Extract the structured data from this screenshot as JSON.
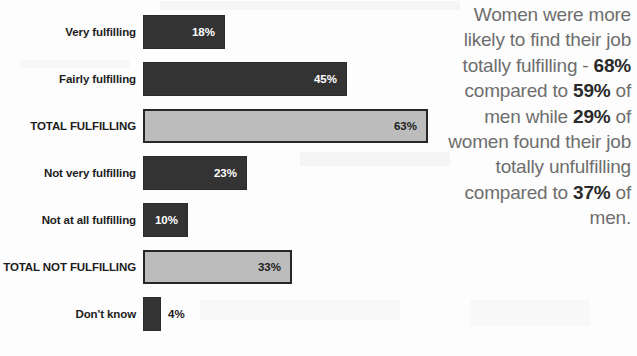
{
  "chart_data": {
    "type": "bar",
    "orientation": "horizontal",
    "title": "",
    "xlabel": "",
    "ylabel": "",
    "xlim": [
      0,
      70
    ],
    "grid": false,
    "legend": null,
    "value_suffix": "%",
    "categories": [
      "Very fulfilling",
      "Fairly fulfilling",
      "TOTAL FULFILLING",
      "Not very fulfilling",
      "Not at all fulfilling",
      "TOTAL NOT FULFILLING",
      "Don't know"
    ],
    "values": [
      18,
      45,
      63,
      23,
      10,
      33,
      4
    ],
    "value_labels": [
      "18%",
      "45%",
      "63%",
      "23%",
      "10%",
      "33%",
      "4%"
    ],
    "bar_styles": [
      "dark",
      "dark",
      "light",
      "dark",
      "dark",
      "light",
      "dark"
    ],
    "label_placement": [
      "inside",
      "inside",
      "inside",
      "inside",
      "inside",
      "inside",
      "outside"
    ],
    "colors": {
      "dark_fill": "#333333",
      "dark_border": "#2b2b2b",
      "light_fill": "#bcbcbc",
      "light_border": "#262626",
      "dark_value_text": "#ffffff",
      "light_value_text": "#1c1c1c",
      "category_text": "#1c1c1c",
      "sidenote_text": "#6e6e6e",
      "sidenote_highlight": "#2a2a2a",
      "background": "#ffffff"
    },
    "rows": [
      {
        "category": "Very fulfilling",
        "value": 18,
        "label": "18%",
        "style": "dark",
        "placement": "inside"
      },
      {
        "category": "Fairly fulfilling",
        "value": 45,
        "label": "45%",
        "style": "dark",
        "placement": "inside"
      },
      {
        "category": "TOTAL FULFILLING",
        "value": 63,
        "label": "63%",
        "style": "light",
        "placement": "inside"
      },
      {
        "category": "Not very fulfilling",
        "value": 23,
        "label": "23%",
        "style": "dark",
        "placement": "inside"
      },
      {
        "category": "Not at all fulfilling",
        "value": 10,
        "label": "10%",
        "style": "dark",
        "placement": "inside"
      },
      {
        "category": "TOTAL NOT FULFILLING",
        "value": 33,
        "label": "33%",
        "style": "light",
        "placement": "inside"
      },
      {
        "category": "Don't know",
        "value": 4,
        "label": "4%",
        "style": "dark",
        "placement": "outside"
      }
    ]
  },
  "chart": {
    "rows": [
      {
        "label": "Very fulfilling",
        "value": "18%"
      },
      {
        "label": "Fairly fulfilling",
        "value": "45%"
      },
      {
        "label": "TOTAL FULFILLING",
        "value": "63%"
      },
      {
        "label": "Not very fulfilling",
        "value": "23%"
      },
      {
        "label": "Not at all fulfilling",
        "value": "10%"
      },
      {
        "label": "TOTAL NOT FULFILLING",
        "value": "33%"
      },
      {
        "label": "Don't know",
        "value": "4%"
      }
    ]
  },
  "sidenote": {
    "segments": [
      {
        "text": "Women were more likely to find their job totally fulfilling - ",
        "bold": false
      },
      {
        "text": "68%",
        "bold": true
      },
      {
        "text": " compared to ",
        "bold": false
      },
      {
        "text": "59%",
        "bold": true
      },
      {
        "text": " of men while ",
        "bold": false
      },
      {
        "text": "29%",
        "bold": true
      },
      {
        "text": " of women found their job totally unfulfilling compared to ",
        "bold": false
      },
      {
        "text": "37%",
        "bold": true
      },
      {
        "text": " of men.",
        "bold": false
      }
    ],
    "plain_text": "Women were more likely to find their job totally fulfilling - 68% compared to 59% of men while 29% of women found their job totally unfulfilling compared to 37% of men."
  }
}
